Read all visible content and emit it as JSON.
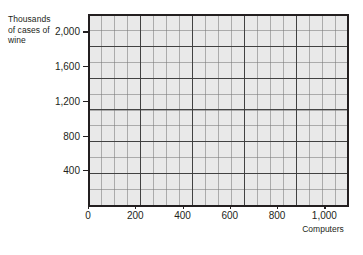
{
  "chart_data": {
    "type": "scatter",
    "title": "",
    "subtitle": "",
    "xlabel": "Computers",
    "ylabel": "Thousands of cases of wine",
    "ylabel_lines": [
      "Thousands",
      "of cases of",
      "wine"
    ],
    "xlim": [
      0,
      1100
    ],
    "ylim": [
      0,
      2200
    ],
    "xticks": [
      0,
      200,
      400,
      600,
      800,
      1000
    ],
    "xtick_labels": [
      "0",
      "200",
      "400",
      "600",
      "800",
      "1,000"
    ],
    "yticks": [
      400,
      800,
      1200,
      1600,
      2000
    ],
    "ytick_labels": [
      "400",
      "800",
      "1,200",
      "1,600",
      "2,000"
    ],
    "grid": true,
    "grid_minor": true,
    "legend": "none",
    "series": [],
    "values": [],
    "annotations": [],
    "note": "Empty graph-paper style axes; no data plotted"
  },
  "style": {
    "plot_background": "#e9e9e9",
    "axis_color": "#231f20",
    "grid_major_color": "#3c3c3c",
    "grid_minor_color": "#787878",
    "page_background": "#ffffff"
  }
}
